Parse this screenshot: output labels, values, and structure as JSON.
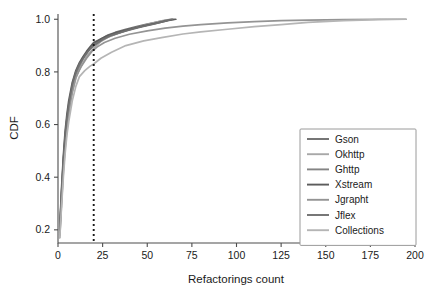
{
  "chart_data": {
    "type": "line",
    "title": "",
    "xlabel": "Refactorings count",
    "ylabel": "CDF",
    "xlim": [
      0,
      200
    ],
    "ylim": [
      0.15,
      1.02
    ],
    "xticks": [
      "0",
      "25",
      "50",
      "75",
      "100",
      "125",
      "150",
      "175",
      "200"
    ],
    "xtick_values": [
      0,
      25,
      50,
      75,
      100,
      125,
      150,
      175,
      200
    ],
    "yticks": [
      "0.2",
      "0.4",
      "0.6",
      "0.8",
      "1.0"
    ],
    "ytick_values": [
      0.2,
      0.4,
      0.6,
      0.8,
      1.0
    ],
    "grid": false,
    "legend_position": "lower-right",
    "annotations": [
      {
        "name": "threshold-line",
        "type": "vertical-dotted-line",
        "x": 20,
        "style": "dotted",
        "color": "#1a1a1a"
      }
    ],
    "series": [
      {
        "name": "Gson",
        "color": "#6f6f6f",
        "x": [
          1,
          2,
          3,
          4,
          5,
          6,
          8,
          10,
          12,
          14,
          16,
          18,
          20,
          24,
          28,
          32,
          38,
          44,
          50,
          56,
          62,
          64
        ],
        "y": [
          0.2,
          0.34,
          0.46,
          0.55,
          0.62,
          0.67,
          0.74,
          0.79,
          0.82,
          0.85,
          0.87,
          0.89,
          0.905,
          0.925,
          0.94,
          0.95,
          0.962,
          0.972,
          0.982,
          0.99,
          0.998,
          1.0
        ]
      },
      {
        "name": "Okhttp",
        "color": "#a8a8a8",
        "x": [
          1,
          2,
          3,
          4,
          5,
          6,
          8,
          10,
          12,
          14,
          16,
          18,
          20,
          24,
          28,
          34,
          40,
          46,
          52,
          58,
          63
        ],
        "y": [
          0.17,
          0.3,
          0.42,
          0.51,
          0.58,
          0.64,
          0.72,
          0.775,
          0.81,
          0.835,
          0.86,
          0.875,
          0.89,
          0.915,
          0.932,
          0.948,
          0.96,
          0.972,
          0.984,
          0.994,
          1.0
        ]
      },
      {
        "name": "Ghttp",
        "color": "#848484",
        "x": [
          1,
          2,
          3,
          4,
          5,
          6,
          8,
          10,
          12,
          14,
          16,
          18,
          20,
          25,
          30,
          36,
          42,
          48,
          54,
          60,
          65
        ],
        "y": [
          0.19,
          0.33,
          0.45,
          0.54,
          0.61,
          0.665,
          0.745,
          0.795,
          0.825,
          0.85,
          0.872,
          0.888,
          0.9,
          0.922,
          0.938,
          0.952,
          0.965,
          0.975,
          0.985,
          0.995,
          1.0
        ]
      },
      {
        "name": "Xstream",
        "color": "#5c5c5c",
        "x": [
          1,
          2,
          3,
          4,
          5,
          6,
          8,
          10,
          12,
          14,
          16,
          18,
          20,
          26,
          32,
          40,
          48,
          56,
          62,
          66
        ],
        "y": [
          0.21,
          0.36,
          0.48,
          0.575,
          0.64,
          0.69,
          0.76,
          0.805,
          0.835,
          0.858,
          0.878,
          0.895,
          0.912,
          0.932,
          0.948,
          0.962,
          0.975,
          0.986,
          0.996,
          1.0
        ]
      },
      {
        "name": "Jgrapht",
        "color": "#949494",
        "x": [
          1,
          2,
          3,
          4,
          5,
          6,
          8,
          10,
          13,
          16,
          19,
          22,
          26,
          32,
          40,
          50,
          60,
          70,
          80,
          95,
          110,
          125,
          140,
          160,
          180,
          195
        ],
        "y": [
          0.18,
          0.31,
          0.43,
          0.52,
          0.59,
          0.645,
          0.725,
          0.78,
          0.82,
          0.852,
          0.878,
          0.895,
          0.912,
          0.928,
          0.943,
          0.956,
          0.966,
          0.974,
          0.98,
          0.986,
          0.991,
          0.995,
          0.997,
          0.999,
          1.0,
          1.0
        ]
      },
      {
        "name": "Jflex",
        "color": "#707070",
        "x": [
          1,
          2,
          3,
          4,
          5,
          6,
          8,
          10,
          12,
          15,
          18,
          20,
          25,
          30,
          38,
          46,
          54,
          60,
          64
        ],
        "y": [
          0.2,
          0.345,
          0.465,
          0.56,
          0.625,
          0.675,
          0.752,
          0.8,
          0.83,
          0.862,
          0.888,
          0.9,
          0.924,
          0.94,
          0.956,
          0.97,
          0.982,
          0.993,
          1.0
        ]
      },
      {
        "name": "Collections",
        "color": "#b5b5b5",
        "x": [
          1,
          2,
          3,
          4,
          5,
          6,
          8,
          10,
          12,
          15,
          18,
          20,
          24,
          30,
          38,
          48,
          58,
          70,
          80,
          95,
          110,
          125,
          140,
          160,
          180,
          195
        ],
        "y": [
          0.17,
          0.29,
          0.4,
          0.49,
          0.56,
          0.61,
          0.69,
          0.745,
          0.782,
          0.805,
          0.822,
          0.83,
          0.852,
          0.875,
          0.9,
          0.918,
          0.93,
          0.944,
          0.952,
          0.962,
          0.972,
          0.98,
          0.988,
          0.995,
          0.999,
          1.0
        ]
      }
    ]
  },
  "legend": {
    "entries": [
      {
        "label": "Gson"
      },
      {
        "label": "Okhttp"
      },
      {
        "label": "Ghttp"
      },
      {
        "label": "Xstream"
      },
      {
        "label": "Jgrapht"
      },
      {
        "label": "Jflex"
      },
      {
        "label": "Collections"
      }
    ]
  },
  "style": {
    "axis_color": "#4d4d4d",
    "text_color": "#1a1a1a",
    "background": "#ffffff",
    "legend_border": "#9a9a9a"
  }
}
